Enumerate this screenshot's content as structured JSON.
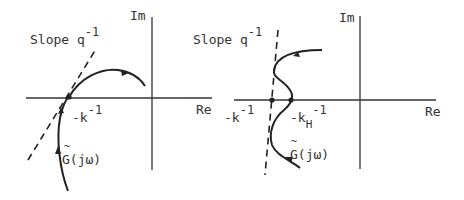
{
  "left_panel": {
    "axis_im": "Im",
    "axis_re": "Re",
    "slope_label": "Slope q",
    "slope_exp": "-1",
    "point_label": "-k",
    "point_exp": "-1",
    "curve_label": "G(jω)",
    "curve_tilde": "~"
  },
  "right_panel": {
    "axis_im": "Im",
    "axis_re": "Re",
    "slope_label": "Slope q",
    "slope_exp": "-1",
    "point_label": "-k",
    "point_exp": "-1",
    "point2_label": "-k",
    "point2_sub": "H",
    "point2_exp": "-1",
    "curve_label": "G(jω)",
    "curve_tilde": "~"
  }
}
